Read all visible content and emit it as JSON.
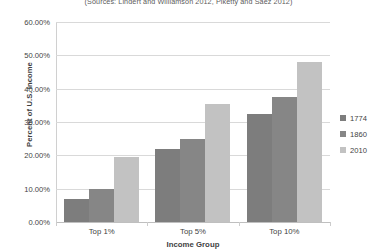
{
  "chart_data": {
    "type": "bar",
    "title": "",
    "subtitle": "(Sources: Lindert and Williamson 2012, Piketty and Saez 2012)",
    "categories": [
      "Top 1%",
      "Top 5%",
      "Top 10%"
    ],
    "series": [
      {
        "name": "1774",
        "values": [
          7.0,
          22.0,
          32.5
        ],
        "color": "#7d7d7d"
      },
      {
        "name": "1860",
        "values": [
          10.0,
          25.0,
          37.5
        ],
        "color": "#868686"
      },
      {
        "name": "2010",
        "values": [
          19.5,
          35.5,
          48.0
        ],
        "color": "#c2c2c2"
      }
    ],
    "xlabel": "Income Group",
    "ylabel": "Percent of U.S. Income",
    "ylim": [
      0,
      60
    ],
    "ytick_labels": [
      "0.00%",
      "10.00%",
      "20.00%",
      "30.00%",
      "40.00%",
      "50.00%",
      "60.00%"
    ],
    "ytick_values": [
      0,
      10,
      20,
      30,
      40,
      50,
      60
    ],
    "grid": true,
    "legend_position": "right"
  },
  "colors": {
    "gridline": "#d9d9d9",
    "text": "#3f3f3f",
    "background": "#ffffff"
  }
}
